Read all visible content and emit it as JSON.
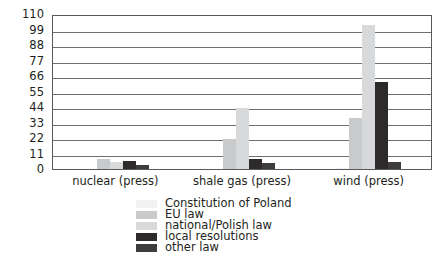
{
  "chart_data": {
    "type": "bar",
    "title": "",
    "subtitle": "",
    "xlabel": "",
    "ylabel": "",
    "ylim": [
      0,
      110
    ],
    "yticks": [
      0,
      11,
      22,
      33,
      44,
      55,
      66,
      77,
      88,
      99,
      110
    ],
    "grid": true,
    "legend_position": "bottom",
    "categories": [
      "nuclear (press)",
      "shale gas (press)",
      "wind (press)"
    ],
    "series": [
      {
        "name": "Constitution of Poland",
        "color": "#f2f2f2",
        "values": [
          0,
          0,
          1
        ]
      },
      {
        "name": "EU law",
        "color": "#c9cacb",
        "values": [
          7,
          21,
          36
        ]
      },
      {
        "name": "national/Polish law",
        "color": "#d8d9da",
        "values": [
          5,
          43,
          102
        ]
      },
      {
        "name": "local resolutions",
        "color": "#2d2a2b",
        "values": [
          6,
          7,
          62
        ]
      },
      {
        "name": "other law",
        "color": "#3f3c3d",
        "values": [
          3,
          4,
          5
        ]
      }
    ]
  },
  "axis": {
    "y_tick_labels": [
      "0",
      "11",
      "22",
      "33",
      "44",
      "55",
      "66",
      "77",
      "88",
      "99",
      "110"
    ]
  },
  "colors": {
    "plot_border": "#58595b",
    "gridline": "#6d6e71",
    "background": "#ffffff",
    "text": "#231f20"
  }
}
